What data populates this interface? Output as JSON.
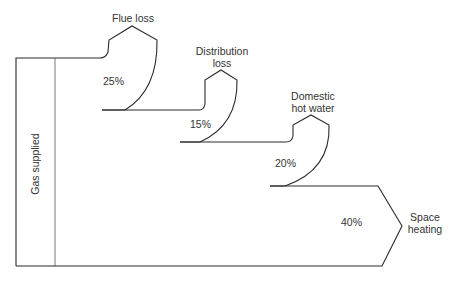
{
  "diagram": {
    "type": "sankey",
    "input": {
      "label": "Gas supplied",
      "percent": 100
    },
    "flows": [
      {
        "id": "flue",
        "label_line1": "Flue loss",
        "label_line2": "",
        "percent_label": "25%",
        "value": 25
      },
      {
        "id": "distribution",
        "label_line1": "Distribution",
        "label_line2": "loss",
        "percent_label": "15%",
        "value": 15
      },
      {
        "id": "hotwater",
        "label_line1": "Domestic",
        "label_line2": "hot water",
        "percent_label": "20%",
        "value": 20
      },
      {
        "id": "space",
        "label_line1": "Space",
        "label_line2": "heating",
        "percent_label": "40%",
        "value": 40
      }
    ],
    "colors": {
      "stroke": "#2a2a2a",
      "text": "#333333",
      "background": "#ffffff"
    }
  }
}
